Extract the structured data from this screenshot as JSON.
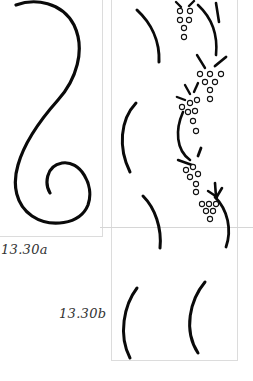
{
  "figure": {
    "panel_a": {
      "label": "13.30a",
      "description": "S-shaped flourish scroll with inner spiral"
    },
    "panel_b": {
      "label": "13.30b",
      "description": "Alternating arc strokes with grape-cluster vine ornament"
    }
  },
  "colors": {
    "ink": "#0a0a0a",
    "frame": "#dcdcdc",
    "caption": "#333333",
    "background": "#ffffff"
  }
}
